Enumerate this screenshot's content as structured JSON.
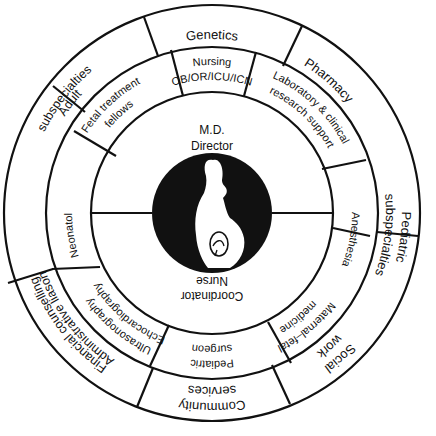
{
  "diagram": {
    "type": "concentric-organization-wheel",
    "center": {
      "top_label_line1": "M.D.",
      "top_label_line2": "Director",
      "bottom_label_line1": "Nurse",
      "bottom_label_line2": "Coordinator",
      "icon": "pregnant-woman-silhouette-icon"
    },
    "middle_ring": [
      {
        "line1": "Pediatric",
        "line2": "surgeon"
      },
      {
        "line1": "Ultrasonography",
        "line2": "Echocardiography"
      },
      {
        "line1": "Neonatology",
        "line2": ""
      },
      {
        "line1": "Fetal treatment",
        "line2": "fellows"
      },
      {
        "line1": "OB/OR/ICU/ICN",
        "line2": "Nursing"
      },
      {
        "line1": "Laboratory & clinical",
        "line2": "research support"
      },
      {
        "line1": "Anesthesia",
        "line2": ""
      },
      {
        "line1": "Maternal–fetal",
        "line2": "medicine"
      }
    ],
    "outer_ring": [
      {
        "line1": "Community",
        "line2": "services"
      },
      {
        "line1": "Financial counselling",
        "line2": "Administrative liason"
      },
      {
        "line1": "Adult",
        "line2": "subspecialties"
      },
      {
        "line1": "Genetics",
        "line2": ""
      },
      {
        "line1": "Pharmacy",
        "line2": ""
      },
      {
        "line1": "Pediatric",
        "line2": "subspecialties"
      },
      {
        "line1": "Social",
        "line2": "work"
      }
    ],
    "colors": {
      "ink": "#111111",
      "background": "#ffffff"
    }
  }
}
